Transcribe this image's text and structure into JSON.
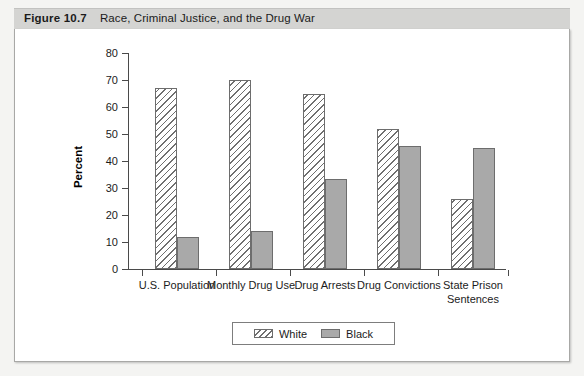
{
  "header": {
    "figure_number": "Figure 10.7",
    "title": "Race, Criminal Justice, and the Drug War"
  },
  "legend": {
    "position": "bottom-center",
    "items": [
      {
        "label": "White",
        "swatch": "hatched-diagonal-swatch"
      },
      {
        "label": "Black",
        "swatch": "solid-gray-swatch"
      }
    ]
  },
  "axes": {
    "ylabel": "Percent",
    "yticks": [
      "0",
      "10",
      "20",
      "30",
      "40",
      "50",
      "60",
      "70",
      "80"
    ]
  },
  "colors": {
    "white_bar_fill": "#ffffff",
    "white_bar_hatch": "#6f6f6f",
    "black_bar_fill": "#a9a9a9",
    "bar_outline": "#6d6d6d",
    "axis": "#4a4a4a",
    "header_bar": "#d4d4d2",
    "page_background": "#f4f4f2",
    "panel_background": "#ffffff"
  },
  "chart_data": {
    "type": "bar",
    "title": "Race, Criminal Justice, and the Drug War",
    "xlabel": "",
    "ylabel": "Percent",
    "ylim": [
      0,
      80
    ],
    "ytick_step": 10,
    "grid": false,
    "legend_position": "bottom-center",
    "categories": [
      "U.S. Population",
      "Monthly Drug Use",
      "Drug Arrests",
      "Drug Convictions",
      "State Prison Sentences"
    ],
    "series": [
      {
        "name": "White",
        "values": [
          67,
          70,
          65,
          52,
          26
        ]
      },
      {
        "name": "Black",
        "values": [
          12,
          14,
          33.5,
          45.5,
          45
        ]
      }
    ]
  }
}
